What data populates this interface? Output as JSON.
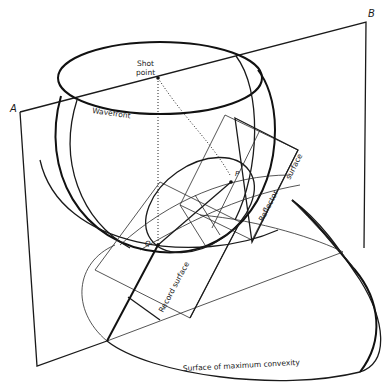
{
  "diagram": {
    "labels": {
      "corner_a": "A",
      "corner_b": "B",
      "shot_point_line1": "Shot",
      "shot_point_line2": "point",
      "wavefront": "Wavefront",
      "point_p": "P",
      "point_q": "Q",
      "reflector_surface_1": "Reflector",
      "reflector_surface_2": "surface",
      "record_surface": "Record surface",
      "surface_max_convexity": "Surface of maximum convexity"
    },
    "colors": {
      "line": "#111111",
      "background": "#ffffff"
    }
  }
}
